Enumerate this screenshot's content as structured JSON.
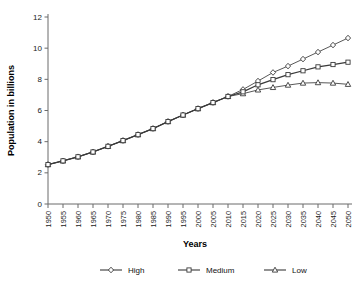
{
  "chart_data": {
    "type": "line",
    "title": "",
    "xlabel": "Years",
    "ylabel": "Population in billions",
    "xlim": [
      1950,
      2050
    ],
    "ylim": [
      0,
      12
    ],
    "yticks": [
      0,
      2,
      4,
      6,
      8,
      10,
      12
    ],
    "grid": false,
    "legend_position": "bottom",
    "categories": [
      1950,
      1955,
      1960,
      1965,
      1970,
      1975,
      1980,
      1985,
      1990,
      1995,
      2000,
      2005,
      2010,
      2015,
      2020,
      2025,
      2030,
      2035,
      2040,
      2045,
      2050
    ],
    "xtick_labels": [
      "1950",
      "1955",
      "1960",
      "1965",
      "1970",
      "1975",
      "1980",
      "1985",
      "1990",
      "1995",
      "2000",
      "2005",
      "2010",
      "2015",
      "2020",
      "2025",
      "2030",
      "2035",
      "2040",
      "2045",
      "2050"
    ],
    "series": [
      {
        "name": "High",
        "marker": "diamond",
        "color": "#3a3a3a",
        "values": [
          2.53,
          2.77,
          3.03,
          3.34,
          3.7,
          4.07,
          4.45,
          4.84,
          5.29,
          5.71,
          6.12,
          6.51,
          6.9,
          7.35,
          7.89,
          8.44,
          8.85,
          9.3,
          9.75,
          10.2,
          10.65
        ]
      },
      {
        "name": "Medium",
        "marker": "square",
        "color": "#3a3a3a",
        "values": [
          2.53,
          2.77,
          3.03,
          3.34,
          3.7,
          4.07,
          4.45,
          4.84,
          5.29,
          5.71,
          6.12,
          6.51,
          6.9,
          7.2,
          7.65,
          7.98,
          8.3,
          8.55,
          8.8,
          8.95,
          9.1
        ]
      },
      {
        "name": "Low",
        "marker": "triangle",
        "color": "#3a3a3a",
        "values": [
          2.53,
          2.77,
          3.03,
          3.34,
          3.7,
          4.07,
          4.45,
          4.84,
          5.29,
          5.71,
          6.12,
          6.51,
          6.9,
          7.08,
          7.32,
          7.48,
          7.63,
          7.76,
          7.79,
          7.76,
          7.68
        ]
      }
    ]
  },
  "legend": {
    "items": [
      {
        "label": "High",
        "marker": "diamond"
      },
      {
        "label": "Medium",
        "marker": "square"
      },
      {
        "label": "Low",
        "marker": "triangle"
      }
    ]
  }
}
